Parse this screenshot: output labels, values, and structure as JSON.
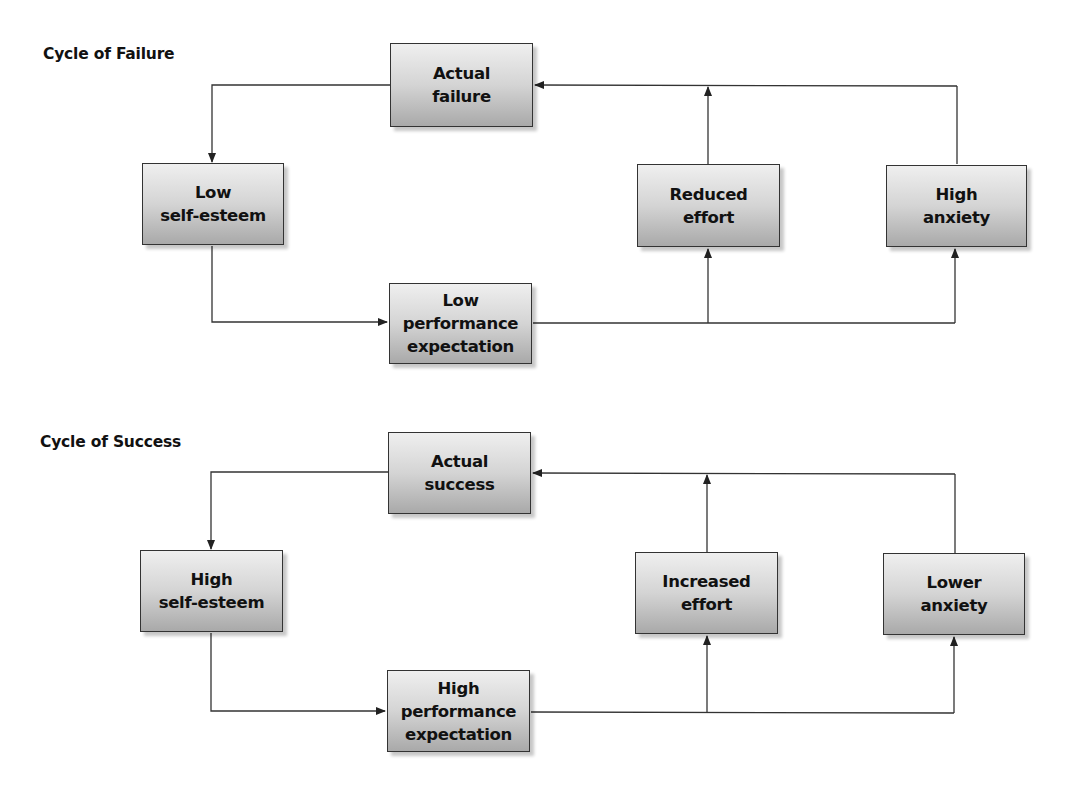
{
  "cycles": {
    "failure": {
      "title": "Cycle of Failure",
      "nodes": {
        "actual": "Actual\nfailure",
        "self_esteem": "Low\nself-esteem",
        "expectation": "Low\nperformance\nexpectation",
        "effort": "Reduced\neffort",
        "anxiety": "High\nanxiety"
      }
    },
    "success": {
      "title": "Cycle of Success",
      "nodes": {
        "actual": "Actual\nsuccess",
        "self_esteem": "High\nself-esteem",
        "expectation": "High\nperformance\nexpectation",
        "effort": "Increased\neffort",
        "anxiety": "Lower\nanxiety"
      }
    }
  },
  "colors": {
    "line": "#333333",
    "box_top": "#efefef",
    "box_bottom": "#a9a9a9"
  }
}
